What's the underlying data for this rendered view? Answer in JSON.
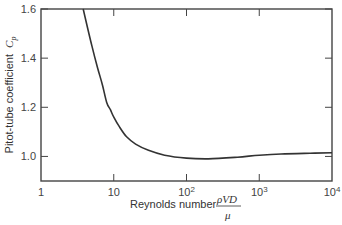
{
  "chart_data": {
    "type": "line",
    "title": "",
    "xlabel": "Reynolds number ρVD/μ",
    "xlabel_text": "Reynolds number",
    "xlabel_fraction": {
      "numerator": "ρVD",
      "denominator": "μ"
    },
    "ylabel": "Pitot-tube coefficient C_p",
    "ylabel_text": "Pitot-tube coefficient",
    "ylabel_symbol": "C",
    "ylabel_subscript": "p",
    "xscale": "log",
    "xlim": [
      1,
      10000
    ],
    "ylim": [
      0.9,
      1.6
    ],
    "x_ticks": [
      "1",
      "10",
      "10^2",
      "10^3",
      "10^4"
    ],
    "x_tick_labels": [
      {
        "base": "1",
        "exp": ""
      },
      {
        "base": "10",
        "exp": ""
      },
      {
        "base": "10",
        "exp": "2"
      },
      {
        "base": "10",
        "exp": "3"
      },
      {
        "base": "10",
        "exp": "4"
      }
    ],
    "y_ticks": [
      "1.0",
      "1.2",
      "1.4",
      "1.6"
    ],
    "grid": false,
    "legend": null,
    "series": [
      {
        "name": "Cp vs Re",
        "x": [
          3.8,
          5,
          6,
          7,
          8,
          9,
          10,
          12,
          15,
          20,
          30,
          50,
          100,
          200,
          500,
          1000,
          2000,
          5000,
          10000
        ],
        "y": [
          1.6,
          1.45,
          1.36,
          1.29,
          1.22,
          1.19,
          1.16,
          1.12,
          1.08,
          1.05,
          1.025,
          1.005,
          0.993,
          0.99,
          0.997,
          1.005,
          1.01,
          1.013,
          1.015
        ]
      }
    ]
  }
}
